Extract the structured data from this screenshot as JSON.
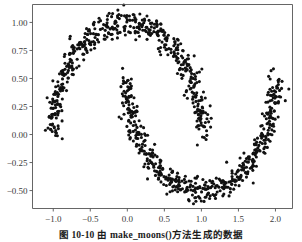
{
  "figure": {
    "caption": "图 10-10   由 make_moons()方法生成的数据",
    "background_color": "#ffffff",
    "axis_color": "#555555",
    "point_color": "#111111"
  },
  "chart_data": {
    "type": "scatter",
    "title": "",
    "xlabel": "",
    "ylabel": "",
    "xlim": [
      -1.28,
      2.23
    ],
    "ylim": [
      -0.66,
      1.16
    ],
    "grid": false,
    "legend": null,
    "xticks": [
      -1.0,
      -0.5,
      0.0,
      0.5,
      1.0,
      1.5,
      2.0
    ],
    "xticklabels": [
      "-1.0",
      "-0.5",
      "0.0",
      "0.5",
      "1.0",
      "1.5",
      "2.0"
    ],
    "yticks": [
      1.0,
      0.75,
      0.5,
      0.25,
      0.0,
      -0.25,
      -0.5
    ],
    "yticklabels": [
      "1.00",
      "0.75",
      "0.50",
      "0.25",
      "0.00",
      "-0.25",
      "-0.50"
    ],
    "marker": "o",
    "marker_size": 2.0,
    "series": [
      {
        "name": "make_moons samples",
        "color": "#111111",
        "description": "Two interleaving half circles (moons) with gaussian noise, n_samples=1000, noise≈0.05",
        "generator": {
          "upper_moon": {
            "x": "cos(t)",
            "y": "sin(t)",
            "t_range": [
              0,
              3.14159
            ]
          },
          "lower_moon": {
            "x": "1 - cos(t)",
            "y": "0.5 - sin(t)",
            "t_range": [
              0,
              3.14159
            ]
          },
          "n_per_moon": 500,
          "noise_std": 0.055
        }
      }
    ]
  }
}
